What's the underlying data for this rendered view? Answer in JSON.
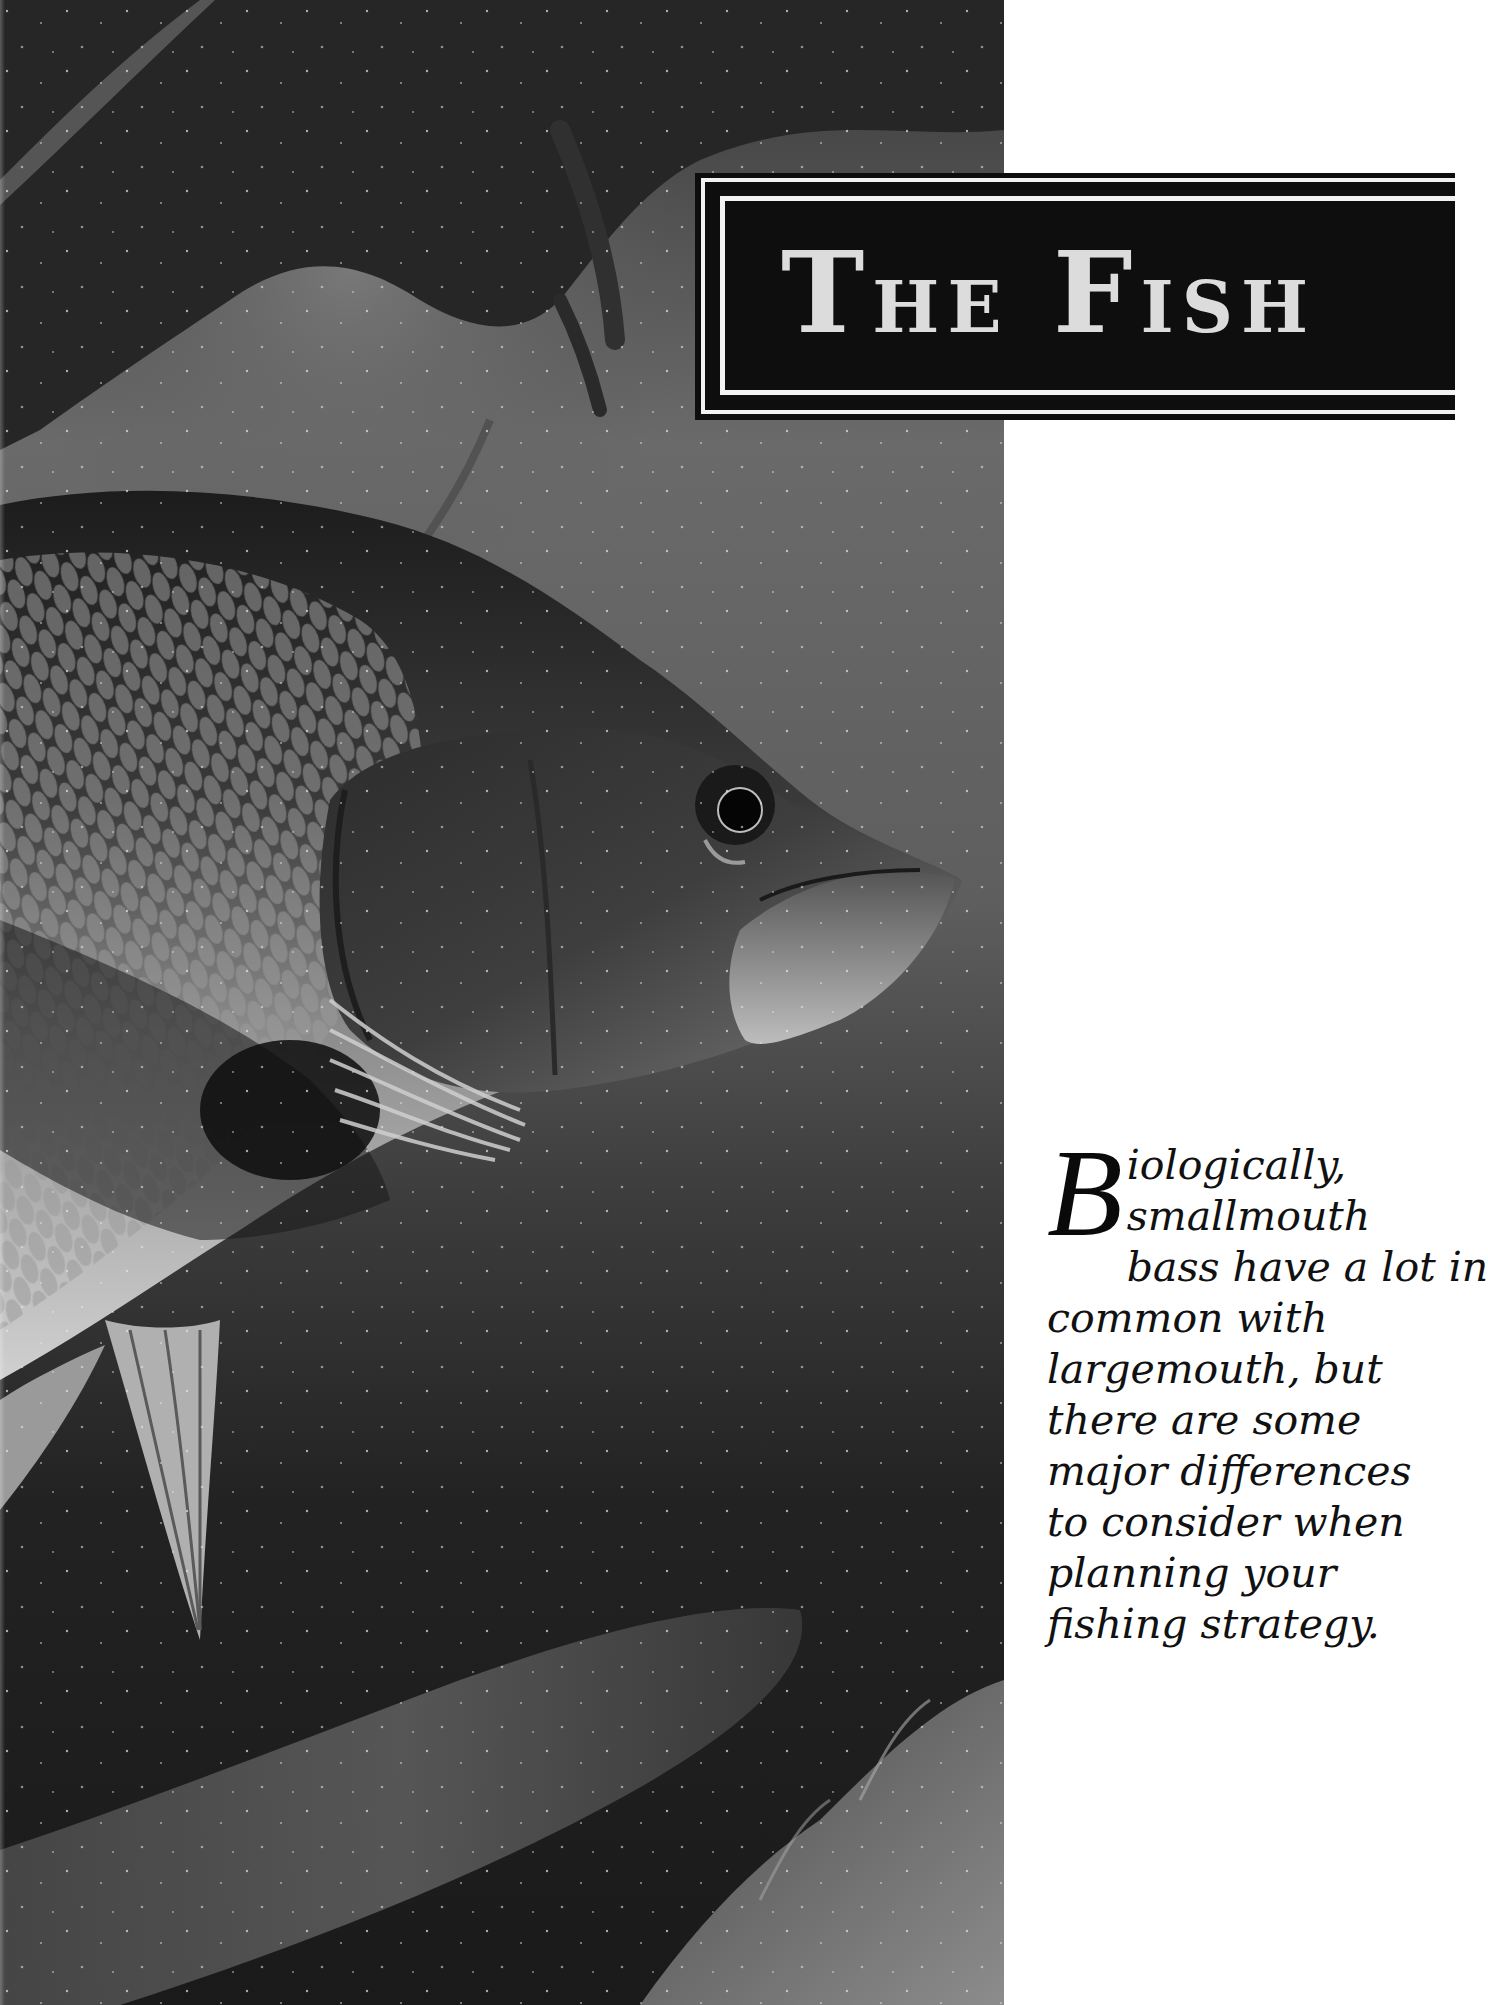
{
  "page": {
    "background": "#ffffff"
  },
  "photo": {
    "subject": "smallmouth bass underwater",
    "icon": "fish-photo",
    "tone": "grayscale"
  },
  "banner": {
    "title_first_letter_1": "T",
    "title_rest_1": "he",
    "title_first_letter_2": "F",
    "title_rest_2": "ish",
    "title_full": "The Fish",
    "fill_color": "#0e0e0e",
    "rule_color": "#f2f2f2",
    "text_color": "#dcdcdc"
  },
  "intro": {
    "drop_cap": "B",
    "lines": [
      "iologically,",
      "smallmouth",
      "bass have a lot in",
      "common with",
      "largemouth, but",
      "there are some",
      "major differences",
      "to consider when",
      "planning your",
      "fishing strategy."
    ],
    "full_text": "Biologically, smallmouth bass have a lot in common with largemouth, but there are some major differences to consider when planning your fishing strategy."
  }
}
